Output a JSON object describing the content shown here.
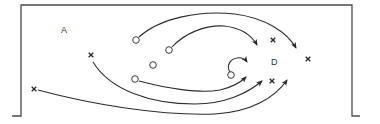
{
  "diagram": {
    "type": "set-play-diagram",
    "labels": {
      "zone_a": "A",
      "zone_d": "D"
    },
    "colors": {
      "line": "#2b2b2b",
      "frame": "#4a4a4a",
      "background": "#ffffff"
    },
    "circles": [
      {
        "id": "o1",
        "x": 136,
        "y": 40
      },
      {
        "id": "o2",
        "x": 169,
        "y": 50
      },
      {
        "id": "o3",
        "x": 153,
        "y": 65
      },
      {
        "id": "o4",
        "x": 135,
        "y": 79
      },
      {
        "id": "o5",
        "x": 231,
        "y": 75
      }
    ],
    "crosses": [
      {
        "id": "x1",
        "x": 91,
        "y": 55
      },
      {
        "id": "x2",
        "x": 34,
        "y": 89
      },
      {
        "id": "x3",
        "x": 273,
        "y": 40
      },
      {
        "id": "x4",
        "x": 308,
        "y": 59
      },
      {
        "id": "x5",
        "x": 272,
        "y": 81
      }
    ],
    "movements": [
      {
        "from": "o1",
        "to_arrow": [
          296,
          48
        ]
      },
      {
        "from": "o2",
        "to_arrow": [
          257,
          45
        ]
      },
      {
        "from": "o4",
        "to_arrow": [
          246,
          77
        ]
      },
      {
        "from": "o5",
        "to_arrow": [
          247,
          62
        ]
      },
      {
        "from": "x1",
        "to_arrow": [
          262,
          81
        ]
      },
      {
        "from": "x2",
        "to_arrow": [
          287,
          80
        ]
      }
    ]
  }
}
